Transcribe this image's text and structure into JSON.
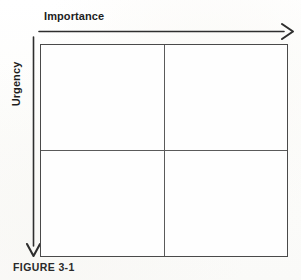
{
  "figure": {
    "caption": "FIGURE 3-1",
    "axes": {
      "horizontal": {
        "label": "Importance",
        "arrow_icon": "arrow-right-icon",
        "direction": "left-to-right"
      },
      "vertical": {
        "label": "Urgency",
        "arrow_icon": "arrow-down-icon",
        "direction": "top-to-bottom"
      }
    },
    "matrix": {
      "rows": 2,
      "columns": 2,
      "quadrants": [
        {
          "id": "top-left",
          "label": ""
        },
        {
          "id": "top-right",
          "label": ""
        },
        {
          "id": "bottom-left",
          "label": ""
        },
        {
          "id": "bottom-right",
          "label": ""
        }
      ]
    },
    "colors": {
      "ink": "#1d1d1d",
      "line": "#4a4a4a",
      "divider": "#5a5a5a",
      "paper": "#fdfdfc"
    }
  }
}
